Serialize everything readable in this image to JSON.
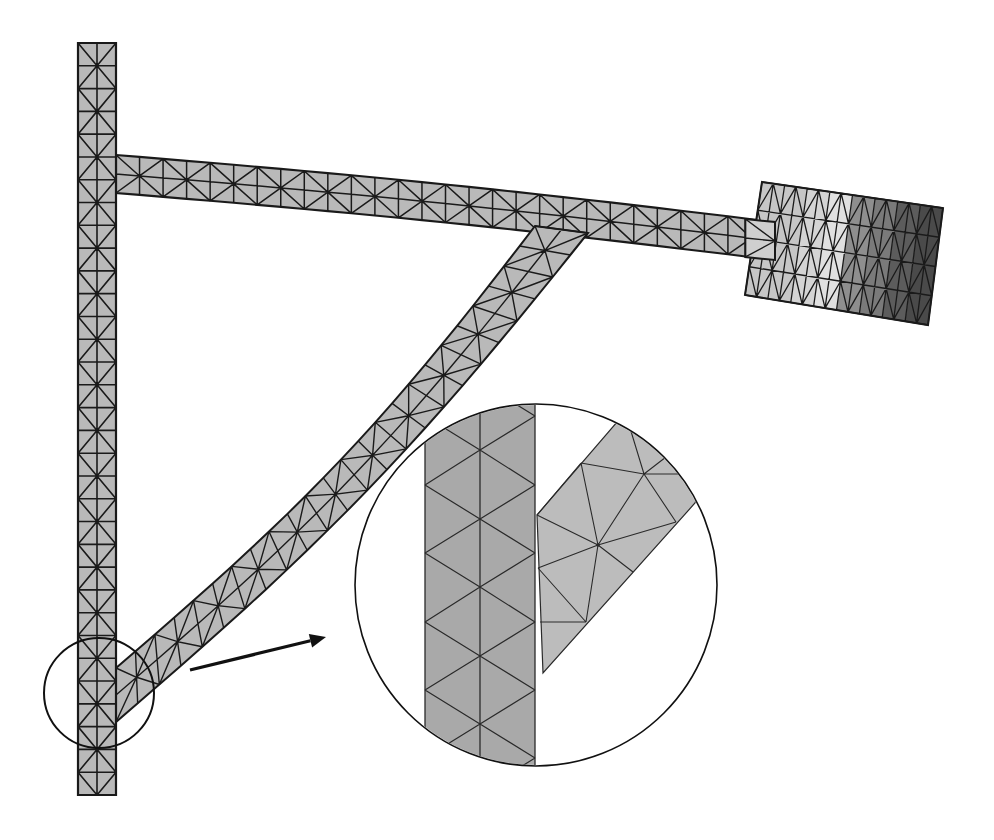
{
  "diagram": {
    "colors": {
      "background": "#ffffff",
      "mesh_fill": "#b9b9b9",
      "mesh_line": "#1a1a1a",
      "inset_bar_fill": "#a9a9a9",
      "inset_strut_fill": "#bcbcbc",
      "inset_line": "#2a2a2a",
      "circle_stroke": "#111111",
      "arrow": "#111111",
      "block_shades": [
        "#c6c6c6",
        "#d4d4d4",
        "#e0e0e0",
        "#8e8e8e",
        "#7a7a7a",
        "#5c5c5c",
        "#4a4a4a"
      ]
    },
    "vertical_bar": {
      "x0": 78,
      "x1": 116,
      "y0": 43,
      "y1": 795,
      "segments": 33
    },
    "horizontal_arm": {
      "start_top": [
        116,
        155
      ],
      "start_bottom": [
        116,
        193
      ],
      "end_top": [
        775,
        222
      ],
      "end_bottom": [
        775,
        260
      ],
      "segments": 28
    },
    "diagonal_strut": {
      "start_a": [
        116,
        668
      ],
      "start_b": [
        116,
        722
      ],
      "end_a": [
        535,
        226
      ],
      "end_b": [
        588,
        233
      ],
      "segments": 24
    },
    "end_block": {
      "corners": [
        [
          762,
          182
        ],
        [
          943,
          208
        ],
        [
          928,
          325
        ],
        [
          745,
          295
        ]
      ],
      "cols": 8,
      "rows": 4,
      "label": "load mass (stress-shaded)"
    },
    "detail_circle_small": {
      "cx": 99,
      "cy": 693,
      "r": 55
    },
    "arrow": {
      "x1": 190,
      "y1": 670,
      "x2": 326,
      "y2": 637
    },
    "detail_circle_large": {
      "cx": 536,
      "cy": 585,
      "r": 181
    },
    "inset": {
      "bar": {
        "x0": 425,
        "x1": 535,
        "xm": 480
      },
      "bar_mid_nodes_y": [
        382,
        450,
        519,
        587,
        656,
        724,
        792
      ],
      "bar_side_nodes_y": [
        416,
        485,
        553,
        622,
        690,
        758
      ],
      "strut_polygon": [
        [
          537,
          515
        ],
        [
          617,
          422
        ],
        [
          732,
          410
        ],
        [
          695,
          503
        ],
        [
          543,
          673
        ]
      ],
      "strut_edges": [
        [
          [
            537,
            515
          ],
          [
            598,
            545
          ]
        ],
        [
          [
            581,
            463
          ],
          [
            598,
            545
          ]
        ],
        [
          [
            644,
            474
          ],
          [
            598,
            545
          ]
        ],
        [
          [
            598,
            545
          ],
          [
            676,
            522
          ]
        ],
        [
          [
            598,
            545
          ],
          [
            586,
            622
          ]
        ],
        [
          [
            598,
            545
          ],
          [
            633,
            572
          ]
        ],
        [
          [
            538,
            568
          ],
          [
            598,
            545
          ]
        ],
        [
          [
            538,
            568
          ],
          [
            586,
            622
          ]
        ],
        [
          [
            540,
            622
          ],
          [
            586,
            622
          ]
        ],
        [
          [
            581,
            463
          ],
          [
            644,
            474
          ]
        ],
        [
          [
            644,
            474
          ],
          [
            680,
            474
          ]
        ],
        [
          [
            644,
            474
          ],
          [
            630,
            428
          ]
        ],
        [
          [
            644,
            474
          ],
          [
            676,
            522
          ]
        ],
        [
          [
            644,
            474
          ],
          [
            666,
            457
          ]
        ],
        [
          [
            581,
            463
          ],
          [
            537,
            515
          ]
        ]
      ]
    },
    "caption": "Magnified view of strut-to-column connection showing non-conforming mesh gap"
  }
}
